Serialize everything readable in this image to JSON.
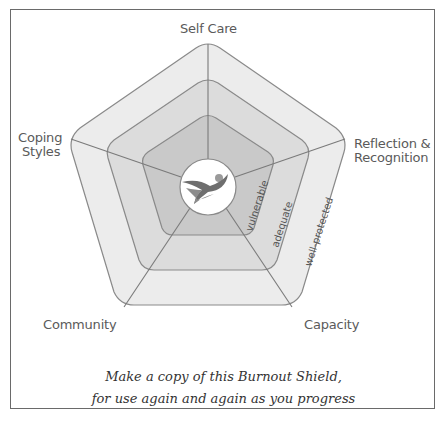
{
  "diagram": {
    "title": "Burnout Shield",
    "axes": [
      "Self Care",
      "Reflection & Recognition",
      "Capacity",
      "Community",
      "Coping Styles"
    ],
    "axis_labels": {
      "top": "Self Care",
      "right_line1": "Reflection &",
      "right_line2": "Recognition",
      "bottom_right": "Capacity",
      "bottom_left": "Community",
      "left_line1": "Coping",
      "left_line2": "Styles"
    },
    "rings": [
      {
        "name": "vulnerable",
        "label": "vulnerable",
        "fill": "#c9c9c9"
      },
      {
        "name": "adequate",
        "label": "adequate",
        "fill": "#dcdcdc"
      },
      {
        "name": "well-protected",
        "label": "well-protected",
        "fill": "#ececec"
      }
    ],
    "center_icon": "flying-figure-logo",
    "colors": {
      "stroke": "#8a8a8a",
      "text": "#5a5a5a",
      "frame": "#6a6a6a"
    }
  },
  "caption": {
    "line1": "Make a copy of this Burnout Shield,",
    "line2": "for use again and again as you progress"
  }
}
